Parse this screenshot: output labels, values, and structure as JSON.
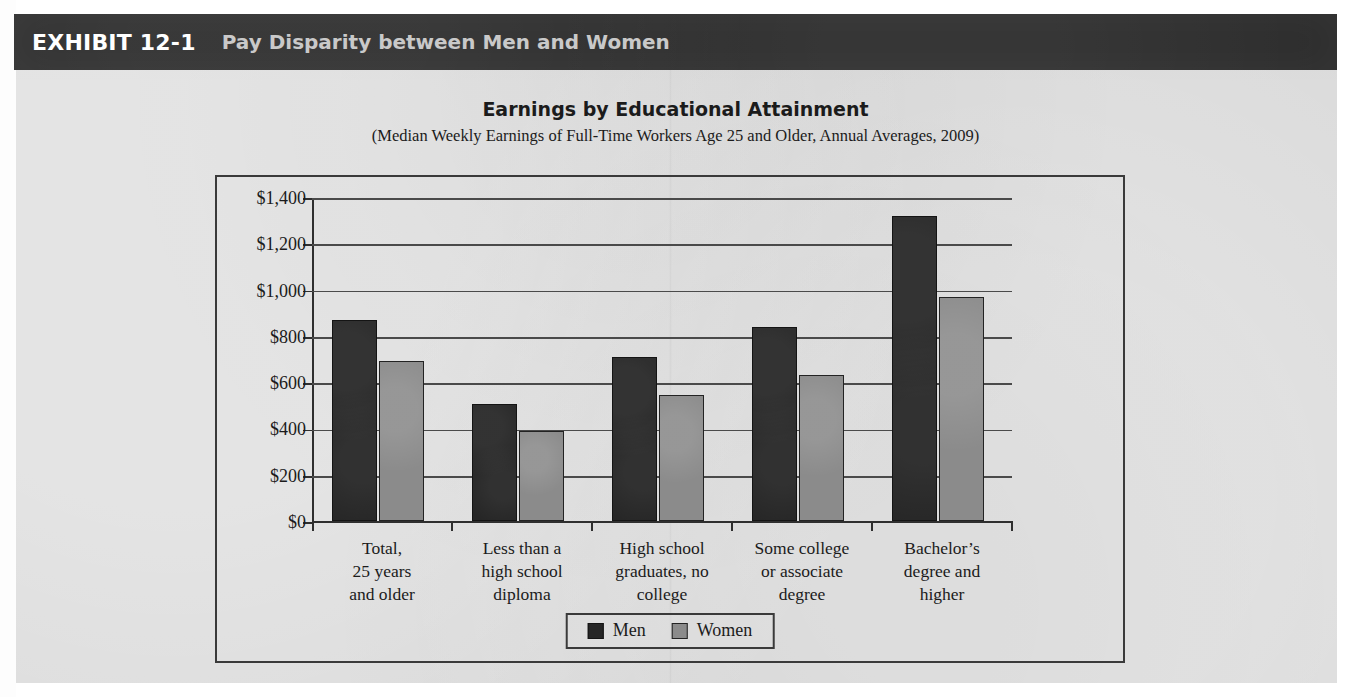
{
  "exhibit": {
    "number": "EXHIBIT 12-1",
    "title": "Pay Disparity between Men and Women"
  },
  "colors": {
    "band_background": "#2e2e2e",
    "band_number_text": "#ffffff",
    "band_title_text": "#c9c9c9",
    "paper": "#d9d9d9",
    "men_series": "#262626",
    "women_series": "#8b8b8b",
    "axis": "#2f2f2f",
    "gridline": "#4a4a4a"
  },
  "chart_data": {
    "type": "bar",
    "title": "Earnings by Educational Attainment",
    "subtitle": "(Median Weekly Earnings of Full-Time Workers Age 25 and Older, Annual Averages, 2009)",
    "xlabel": "",
    "ylabel": "",
    "ylim": [
      0,
      1400
    ],
    "ytick_step": 200,
    "grid": true,
    "legend_position": "bottom-center",
    "categories": [
      "Total,\n25 years\nand older",
      "Less than a\nhigh school\ndiploma",
      "High school\ngraduates, no\ncollege",
      "Some college\nor associate\ndegree",
      "Bachelor's\ndegree and\nhigher"
    ],
    "category_lines": [
      [
        "Total,",
        "25 years",
        "and older"
      ],
      [
        "Less than a",
        "high school",
        "diploma"
      ],
      [
        "High school",
        "graduates, no",
        "college"
      ],
      [
        "Some college",
        "or associate",
        "degree"
      ],
      [
        "Bachelor’s",
        "degree and",
        "higher"
      ]
    ],
    "ytick_labels": [
      "$1,400",
      "$1,200",
      "$1,000",
      "$800",
      "$600",
      "$400",
      "$200",
      "$0"
    ],
    "ytick_values": [
      1400,
      1200,
      1000,
      800,
      600,
      400,
      200,
      0
    ],
    "series": [
      {
        "name": "Men",
        "color": "#262626",
        "values": [
          870,
          505,
          710,
          840,
          1320
        ]
      },
      {
        "name": "Women",
        "color": "#8b8b8b",
        "values": [
          690,
          390,
          545,
          630,
          970
        ]
      }
    ]
  }
}
